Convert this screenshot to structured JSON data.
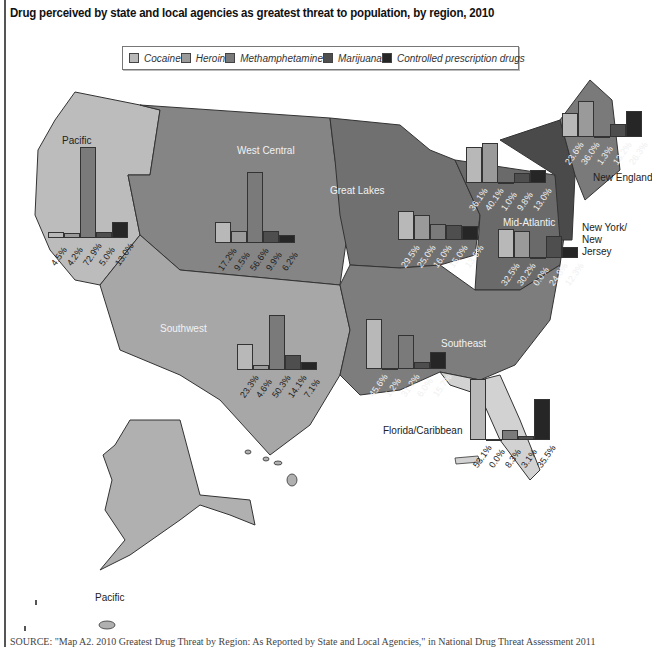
{
  "title": "Drug perceived by state and local agencies as greatest threat to population, by region, 2010",
  "legend": [
    {
      "label": "Cocaine",
      "color": "#b8b8b8"
    },
    {
      "label": "Heroin",
      "color": "#9a9a9a"
    },
    {
      "label": "Methamphetamine",
      "color": "#7a7a7a"
    },
    {
      "label": "Marijuana",
      "color": "#4e4e4e"
    },
    {
      "label": "Controlled prescription drugs",
      "color": "#262626"
    }
  ],
  "regions": {
    "pacific": "Pacific",
    "west_central": "West Central",
    "great_lakes": "Great Lakes",
    "new_england": "New England",
    "mid_atlantic": "Mid-Atlantic",
    "ny_nj": "New York/ New Jersey",
    "southwest": "Southwest",
    "southeast": "Southeast",
    "florida": "Florida/Caribbean",
    "pacific_islands": "Pacific"
  },
  "source": "SOURCE: \"Map A2. 2010 Greatest Drug Threat by Region: As Reported by State and Local Agencies,\" in National Drug Threat Assessment 2011",
  "chart_data": {
    "type": "bar",
    "title": "Drug perceived by state and local agencies as greatest threat to population, by region, 2010",
    "categories": [
      "Cocaine",
      "Heroin",
      "Methamphetamine",
      "Marijuana",
      "Controlled prescription drugs"
    ],
    "unit": "%",
    "layout": "small-multiple bar charts overlaid on US regional map; legend at top center",
    "series": [
      {
        "name": "Pacific",
        "values": [
          4.5,
          4.2,
          72.9,
          5.0,
          13.0
        ],
        "labels": [
          "4.5%",
          "4.2%",
          "72.9%",
          "5.0%",
          "13.0%"
        ]
      },
      {
        "name": "West Central",
        "values": [
          17.2,
          9.5,
          56.6,
          9.9,
          6.2
        ],
        "labels": [
          "17.2%",
          "9.5%",
          "56.6%",
          "9.9%",
          "6.2%"
        ]
      },
      {
        "name": "Great Lakes",
        "values": [
          29.5,
          25.0,
          16.0,
          15.0,
          13.6
        ],
        "labels": [
          "29.5%",
          "25.0%",
          "16.0%",
          "15.0%",
          "13.6%"
        ]
      },
      {
        "name": "Mid-Atlantic",
        "values": [
          36.1,
          40.1,
          1.0,
          9.8,
          13.0
        ],
        "labels": [
          "36.1%",
          "40.1%",
          "1.0%",
          "9.8%",
          "13.0%"
        ]
      },
      {
        "name": "New England",
        "values": [
          23.6,
          36.0,
          1.3,
          13.2,
          26.3
        ],
        "labels": [
          "23.6%",
          "36.0%",
          "1.3%",
          "13.2%",
          "26.3%"
        ]
      },
      {
        "name": "New York/New Jersey",
        "values": [
          32.5,
          30.2,
          0.0,
          24.8,
          12.3
        ],
        "labels": [
          "32.5%",
          "30.2%",
          "0.0%",
          "24.8%",
          "12.3%"
        ]
      },
      {
        "name": "Southwest",
        "values": [
          23.3,
          4.6,
          50.3,
          14.1,
          7.1
        ],
        "labels": [
          "23.3%",
          "4.6%",
          "50.3%",
          "14.1%",
          "7.1%"
        ]
      },
      {
        "name": "Southeast",
        "values": [
          45.6,
          1.2,
          31.2,
          6.0,
          15.7
        ],
        "labels": [
          "45.6%",
          "1.2%",
          "31.2%",
          "6.0%",
          "15.7%"
        ]
      },
      {
        "name": "Florida/Caribbean",
        "values": [
          53.1,
          0.0,
          8.3,
          3.1,
          35.5
        ],
        "labels": [
          "53.1%",
          "0.0%",
          "8.3%",
          "3.1%",
          "35.5%"
        ]
      }
    ],
    "xlabel": "",
    "ylabel": "Percent of agencies",
    "ylim": [
      0,
      100
    ],
    "grid": false,
    "legend_position": "top"
  }
}
